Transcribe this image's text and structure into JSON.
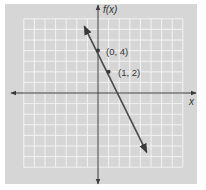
{
  "chart_data": {
    "type": "line",
    "title": "",
    "xlabel": "x",
    "ylabel": "f(x)",
    "xlim": [
      -7,
      8
    ],
    "ylim": [
      -7,
      7
    ],
    "grid": true,
    "series": [
      {
        "name": "f(x) = -2x + 4",
        "x": [
          -1.3,
          4.6
        ],
        "y": [
          6.3,
          -5.6
        ],
        "arrows": "both"
      }
    ],
    "points": [
      {
        "x": 0,
        "y": 4,
        "label": "(0, 4)"
      },
      {
        "x": 1,
        "y": 2,
        "label": "(1, 2)"
      }
    ]
  },
  "labels": {
    "y_axis": "f(x)",
    "x_axis": "x",
    "point1": "(0, 4)",
    "point2": "(1, 2)"
  },
  "colors": {
    "panel": "#d6d6d6",
    "grid": "#f3f3f3",
    "axis": "#3a3a3a",
    "line": "#4a4a4a"
  }
}
